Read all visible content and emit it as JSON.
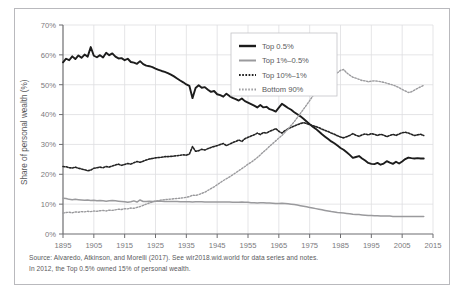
{
  "figure": {
    "caption_lines": [
      "Source: Alvaredo, Atkinson, and Morelli (2017). See wir2018.wid.world for data series and notes.",
      "In 2012, the Top 0.5% owned 15% of personal wealth."
    ]
  },
  "chart_data": {
    "type": "line",
    "title": "",
    "xlabel": "",
    "ylabel": "Share of personal wealth (%)",
    "xlim": [
      1895,
      2015
    ],
    "ylim": [
      0,
      70
    ],
    "grid": true,
    "legend_position": "top-right",
    "x_ticks": [
      "1895",
      "1905",
      "1915",
      "1925",
      "1935",
      "1945",
      "1955",
      "1965",
      "1975",
      "1985",
      "1995",
      "2005",
      "2015"
    ],
    "y_ticks": [
      "0%",
      "10%",
      "20%",
      "30%",
      "40%",
      "50%",
      "60%",
      "70%"
    ],
    "x": [
      1895,
      1896,
      1897,
      1898,
      1899,
      1900,
      1901,
      1902,
      1903,
      1904,
      1905,
      1906,
      1907,
      1908,
      1909,
      1910,
      1911,
      1912,
      1913,
      1914,
      1915,
      1916,
      1917,
      1918,
      1919,
      1920,
      1921,
      1922,
      1923,
      1924,
      1925,
      1926,
      1927,
      1928,
      1929,
      1930,
      1931,
      1932,
      1933,
      1934,
      1935,
      1936,
      1937,
      1938,
      1939,
      1940,
      1941,
      1942,
      1943,
      1944,
      1945,
      1946,
      1947,
      1948,
      1949,
      1950,
      1951,
      1952,
      1953,
      1954,
      1955,
      1956,
      1957,
      1958,
      1959,
      1960,
      1961,
      1962,
      1963,
      1964,
      1965,
      1966,
      1967,
      1968,
      1969,
      1970,
      1971,
      1972,
      1973,
      1974,
      1975,
      1976,
      1977,
      1978,
      1979,
      1980,
      1981,
      1982,
      1983,
      1984,
      1985,
      1986,
      1987,
      1988,
      1989,
      1990,
      1991,
      1992,
      1993,
      1994,
      1995,
      1996,
      1997,
      1998,
      1999,
      2000,
      2001,
      2002,
      2003,
      2004,
      2005,
      2006,
      2007,
      2008,
      2009,
      2010,
      2011,
      2012
    ],
    "series": [
      {
        "name": "Top 0.5%",
        "style": "solid-thick",
        "color": "#1c1c1c",
        "values": [
          57.5,
          58.7,
          58.2,
          59.5,
          58.6,
          59.8,
          59.0,
          60.1,
          59.4,
          62.6,
          59.7,
          59.2,
          59.9,
          59.1,
          60.7,
          59.9,
          60.5,
          59.4,
          58.8,
          58.9,
          58.2,
          58.7,
          57.6,
          57.4,
          57.0,
          57.9,
          56.9,
          56.4,
          56.2,
          55.9,
          55.4,
          55.0,
          54.6,
          54.3,
          53.9,
          53.4,
          52.8,
          52.1,
          51.4,
          50.8,
          50.1,
          49.6,
          45.5,
          48.9,
          49.8,
          49.0,
          49.2,
          48.3,
          47.6,
          47.9,
          46.8,
          46.5,
          46.0,
          47.0,
          46.2,
          45.6,
          45.2,
          44.7,
          45.4,
          44.5,
          44.0,
          43.5,
          43.0,
          42.4,
          43.2,
          42.4,
          42.6,
          41.8,
          41.5,
          41.0,
          42.3,
          43.6,
          42.9,
          42.2,
          41.6,
          40.8,
          40.1,
          39.4,
          38.6,
          37.7,
          36.8,
          35.9,
          35.2,
          34.3,
          33.4,
          32.6,
          31.8,
          31.0,
          30.4,
          29.6,
          28.8,
          28.2,
          27.4,
          26.5,
          25.5,
          25.8,
          26.1,
          25.3,
          24.6,
          23.8,
          23.5,
          23.4,
          23.8,
          23.2,
          23.6,
          24.4,
          23.9,
          23.5,
          24.2,
          23.6,
          24.3,
          25.1,
          25.6,
          25.4,
          25.3,
          25.4,
          25.3,
          25.3
        ],
        "end_label_value": 15
      },
      {
        "name": "Top 1%–0.5%",
        "style": "solid-medium",
        "color": "#9a9a9d",
        "values": [
          12.0,
          11.9,
          11.6,
          11.5,
          11.6,
          11.5,
          11.4,
          11.3,
          11.4,
          11.2,
          11.3,
          11.1,
          11.2,
          11.1,
          11.0,
          11.1,
          11.2,
          11.1,
          11.0,
          10.9,
          10.8,
          10.6,
          10.8,
          11.1,
          10.7,
          11.4,
          10.9,
          10.9,
          11.0,
          10.9,
          11.0,
          11.0,
          11.0,
          10.9,
          10.9,
          10.9,
          10.9,
          10.9,
          10.8,
          10.8,
          10.8,
          10.8,
          10.7,
          10.8,
          10.8,
          10.8,
          10.7,
          10.7,
          10.7,
          10.7,
          10.7,
          10.7,
          10.7,
          10.7,
          10.7,
          10.6,
          10.6,
          10.6,
          10.7,
          10.6,
          10.6,
          10.5,
          10.5,
          10.4,
          10.5,
          10.5,
          10.4,
          10.4,
          10.3,
          10.2,
          10.2,
          10.3,
          10.2,
          10.1,
          10.0,
          9.9,
          9.7,
          9.5,
          9.3,
          9.1,
          8.9,
          8.7,
          8.5,
          8.3,
          8.1,
          7.9,
          7.7,
          7.5,
          7.4,
          7.2,
          7.1,
          7.0,
          6.9,
          6.8,
          6.6,
          6.5,
          6.5,
          6.4,
          6.3,
          6.2,
          6.2,
          6.1,
          6.1,
          6.0,
          6.0,
          6.0,
          6.0,
          5.9,
          5.9,
          5.9,
          5.9,
          5.9,
          5.9,
          5.9,
          5.9,
          5.9,
          5.9,
          5.9
        ]
      },
      {
        "name": "Top 10%–1%",
        "style": "dotted-dark",
        "color": "#232323",
        "values": [
          22.6,
          22.5,
          22.2,
          22.1,
          22.4,
          22.0,
          21.8,
          21.5,
          21.2,
          21.4,
          22.0,
          22.2,
          22.4,
          22.2,
          22.6,
          22.4,
          22.8,
          23.1,
          23.4,
          23.0,
          23.3,
          23.6,
          23.4,
          23.9,
          24.3,
          24.0,
          24.4,
          24.8,
          25.1,
          25.3,
          25.5,
          25.6,
          25.7,
          25.9,
          25.9,
          26.0,
          26.1,
          26.2,
          26.4,
          26.5,
          26.4,
          26.8,
          29.3,
          27.7,
          27.9,
          28.4,
          28.1,
          28.6,
          29.0,
          29.3,
          29.6,
          30.0,
          30.3,
          29.6,
          30.1,
          30.6,
          31.0,
          31.5,
          31.0,
          31.9,
          32.4,
          32.8,
          33.2,
          33.8,
          33.3,
          34.0,
          33.8,
          34.4,
          34.8,
          35.3,
          34.4,
          33.8,
          34.6,
          35.2,
          35.7,
          36.2,
          36.6,
          37.0,
          37.3,
          37.0,
          36.6,
          36.3,
          36.0,
          35.6,
          35.1,
          34.7,
          34.3,
          33.8,
          33.4,
          32.9,
          32.5,
          32.2,
          32.6,
          33.0,
          33.6,
          33.1,
          32.7,
          33.2,
          33.5,
          33.2,
          33.6,
          33.4,
          33.0,
          33.4,
          33.1,
          32.6,
          33.0,
          33.4,
          33.0,
          33.5,
          33.9,
          34.1,
          33.8,
          33.4,
          33.0,
          33.2,
          33.4,
          33.0
        ]
      },
      {
        "name": "Bottom 90%",
        "style": "dotted-light",
        "color": "#9a9a9d",
        "values": [
          7.0,
          7.2,
          7.3,
          7.1,
          7.4,
          7.3,
          7.5,
          7.4,
          7.6,
          7.5,
          7.7,
          7.6,
          7.8,
          7.9,
          7.7,
          8.0,
          7.9,
          8.1,
          8.3,
          8.2,
          8.5,
          8.4,
          8.7,
          8.6,
          8.9,
          9.2,
          9.6,
          10.0,
          10.4,
          10.7,
          11.0,
          11.2,
          11.4,
          11.5,
          11.6,
          11.7,
          11.8,
          11.9,
          12.0,
          12.1,
          12.3,
          12.5,
          13.0,
          12.9,
          13.2,
          13.6,
          14.0,
          14.6,
          15.2,
          15.8,
          16.5,
          17.2,
          17.9,
          18.5,
          19.1,
          19.8,
          20.5,
          21.2,
          21.9,
          22.6,
          23.4,
          24.0,
          24.8,
          25.6,
          26.5,
          27.5,
          28.4,
          29.4,
          30.3,
          31.2,
          32.1,
          33.0,
          34.1,
          35.2,
          36.4,
          37.6,
          39.0,
          40.4,
          41.8,
          43.2,
          44.7,
          46.2,
          47.6,
          48.9,
          50.1,
          51.2,
          52.0,
          52.7,
          53.4,
          54.0,
          54.8,
          55.1,
          54.0,
          53.2,
          52.5,
          52.2,
          51.8,
          51.4,
          51.3,
          51.0,
          51.2,
          51.3,
          51.2,
          51.0,
          50.8,
          50.5,
          50.2,
          49.9,
          49.5,
          49.0,
          48.4,
          47.9,
          47.4,
          47.6,
          48.2,
          48.8,
          49.3,
          49.8
        ]
      }
    ]
  }
}
